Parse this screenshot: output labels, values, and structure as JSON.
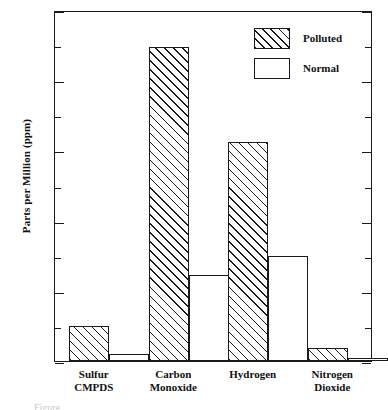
{
  "chart_data": {
    "type": "bar",
    "title": "",
    "subtitle": "",
    "xlabel": "",
    "ylabel": "Parts per Million (ppm)",
    "categories": [
      "Sulfur CMPDS",
      "Carbon Monoxide",
      "Hydrogen",
      "Nitrogen Dioxide"
    ],
    "category_lines": [
      [
        "Sulfur",
        "CMPDS"
      ],
      [
        "Carbon",
        "Monoxide"
      ],
      [
        "Hydrogen",
        ""
      ],
      [
        "Nitrogen",
        "Dioxide"
      ]
    ],
    "series": [
      {
        "name": "Polluted",
        "values": [
          1.0,
          8.95,
          6.25,
          0.37
        ]
      },
      {
        "name": "Normal",
        "values": [
          0.2,
          2.45,
          3.0,
          0.08
        ]
      }
    ],
    "ylim": [
      0,
      10
    ],
    "y_major_ticks": [
      0,
      2,
      4,
      6,
      8,
      10
    ],
    "y_major_tick_labels": [
      "0",
      "2",
      "4",
      "6",
      "8",
      "10"
    ],
    "y_minor_ticks": [
      1,
      3,
      5,
      7,
      9
    ],
    "grid": false,
    "legend_position": "top-right",
    "legend": [
      {
        "label": "Polluted",
        "swatch": "hatched"
      },
      {
        "label": "Normal",
        "swatch": "empty"
      }
    ],
    "colors": {
      "axis": "#1a1a1a",
      "hatch": "#1a1a1a",
      "bar_fill": "#ffffff",
      "background": "#ffffff"
    }
  },
  "caption_fragment": "Figure"
}
